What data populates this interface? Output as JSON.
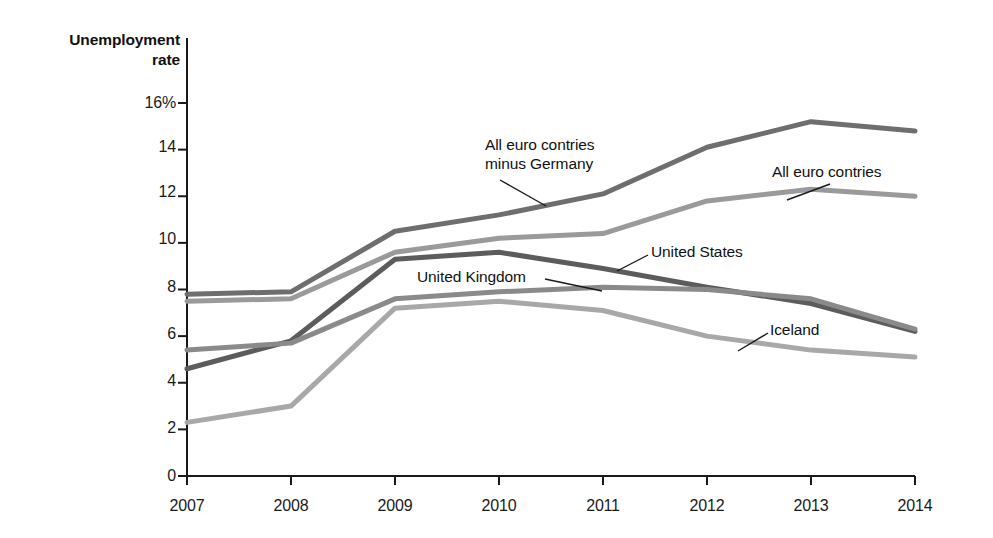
{
  "top_partial_text": "",
  "axis": {
    "y_title_line1": "Unemployment",
    "y_title_line2": "rate",
    "y_ticks": [
      "16%",
      "14",
      "12",
      "10",
      "8",
      "6",
      "4",
      "2",
      "0"
    ],
    "x_ticks": [
      "2007",
      "2008",
      "2009",
      "2010",
      "2011",
      "2012",
      "2013",
      "2014"
    ]
  },
  "annotations": {
    "euro_minus_germany_line1": "All euro contries",
    "euro_minus_germany_line2": "minus Germany",
    "all_euro": "All euro contries",
    "united_states": "United States",
    "united_kingdom": "United Kingdom",
    "iceland": "Iceland"
  },
  "colors": {
    "euro_minus_germany": "#6e6e6e",
    "all_euro": "#9a9a9a",
    "united_states": "#5c5c5c",
    "united_kingdom": "#8a8a8a",
    "iceland": "#a8a8a8",
    "axis": "#1a1a1a",
    "text": "#111111"
  },
  "chart_data": {
    "type": "line",
    "title": "Unemployment rate",
    "xlabel": "",
    "ylabel": "Unemployment rate",
    "x": [
      2007,
      2008,
      2009,
      2010,
      2011,
      2012,
      2013,
      2014
    ],
    "categories": [
      "2007",
      "2008",
      "2009",
      "2010",
      "2011",
      "2012",
      "2013",
      "2014"
    ],
    "ylim": [
      0,
      16
    ],
    "xlim": [
      2007,
      2014
    ],
    "y_tick_values": [
      0,
      2,
      4,
      6,
      8,
      10,
      12,
      14,
      16
    ],
    "grid": false,
    "legend": "inline-annotations",
    "series": [
      {
        "name": "All euro contries minus Germany",
        "color": "#6e6e6e",
        "values": [
          7.8,
          7.9,
          10.5,
          11.2,
          12.1,
          14.1,
          15.2,
          14.8
        ]
      },
      {
        "name": "All euro contries",
        "color": "#9a9a9a",
        "values": [
          7.5,
          7.6,
          9.6,
          10.2,
          10.4,
          11.8,
          12.3,
          12.0
        ]
      },
      {
        "name": "United States",
        "color": "#5c5c5c",
        "values": [
          4.6,
          5.8,
          9.3,
          9.6,
          8.9,
          8.1,
          7.4,
          6.2
        ]
      },
      {
        "name": "United Kingdom",
        "color": "#8a8a8a",
        "values": [
          5.4,
          5.7,
          7.6,
          7.9,
          8.1,
          8.0,
          7.6,
          6.3
        ]
      },
      {
        "name": "Iceland",
        "color": "#a8a8a8",
        "values": [
          2.3,
          3.0,
          7.2,
          7.5,
          7.1,
          6.0,
          5.4,
          5.1
        ]
      }
    ]
  }
}
